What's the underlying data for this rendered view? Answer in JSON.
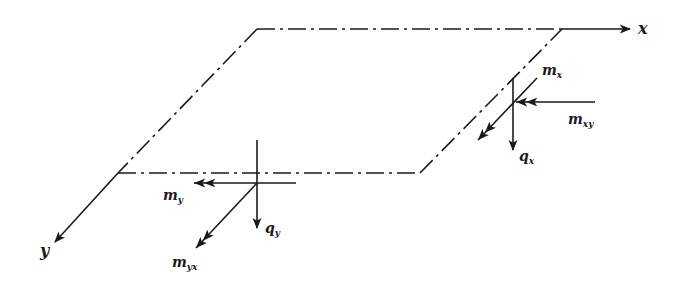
{
  "diagram": {
    "stroke_color": "#1a1a1a",
    "background": "#ffffff",
    "axes": {
      "x": {
        "label": "x"
      },
      "y": {
        "label": "y"
      }
    },
    "right_edge_forces": {
      "moment": {
        "base": "m",
        "sub": "x"
      },
      "twisting": {
        "base": "m",
        "sub": "xy"
      },
      "shear": {
        "base": "q",
        "sub": "x"
      }
    },
    "front_edge_forces": {
      "moment": {
        "base": "m",
        "sub": "y"
      },
      "twisting": {
        "base": "m",
        "sub": "yx"
      },
      "shear": {
        "base": "q",
        "sub": "y"
      }
    }
  }
}
